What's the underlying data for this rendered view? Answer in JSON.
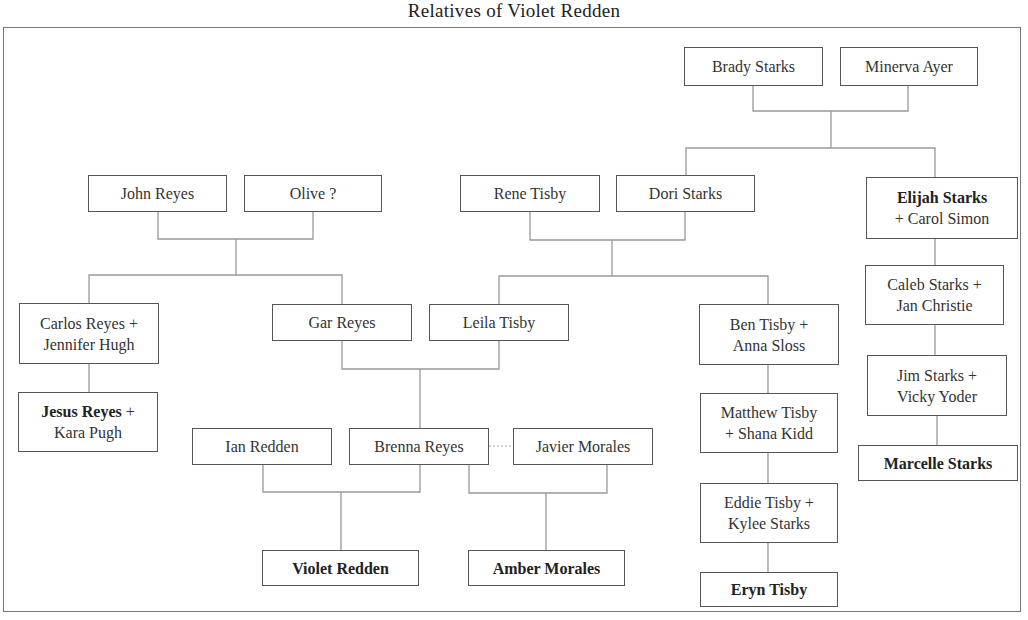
{
  "title": "Relatives of Violet Redden",
  "colors": {
    "box_border": "#555555",
    "line": "#999999",
    "frame": "#777777",
    "text": "#333333"
  },
  "nodes": {
    "brady_starks": {
      "lines": [
        {
          "text": "Brady Starks",
          "bold": false
        }
      ]
    },
    "minerva_ayer": {
      "lines": [
        {
          "text": "Minerva Ayer",
          "bold": false
        }
      ]
    },
    "john_reyes": {
      "lines": [
        {
          "text": "John Reyes",
          "bold": false
        }
      ]
    },
    "olive": {
      "lines": [
        {
          "text": "Olive ?",
          "bold": false
        }
      ]
    },
    "rene_tisby": {
      "lines": [
        {
          "text": "Rene Tisby",
          "bold": false
        }
      ]
    },
    "dori_starks": {
      "lines": [
        {
          "text": "Dori Starks",
          "bold": false
        }
      ]
    },
    "elijah_starks": {
      "lines": [
        {
          "text": "Elijah Starks",
          "bold": true
        },
        {
          "text": "+ Carol Simon",
          "bold": false
        }
      ]
    },
    "carlos_reyes": {
      "lines": [
        {
          "text": "Carlos Reyes +",
          "bold": false
        },
        {
          "text": "Jennifer Hugh",
          "bold": false
        }
      ]
    },
    "gar_reyes": {
      "lines": [
        {
          "text": "Gar Reyes",
          "bold": false
        }
      ]
    },
    "leila_tisby": {
      "lines": [
        {
          "text": "Leila Tisby",
          "bold": false
        }
      ]
    },
    "ben_tisby": {
      "lines": [
        {
          "text": "Ben Tisby +",
          "bold": false
        },
        {
          "text": "Anna Sloss",
          "bold": false
        }
      ]
    },
    "caleb_starks": {
      "lines": [
        {
          "text": "Caleb Starks +",
          "bold": false
        },
        {
          "text": "Jan Christie",
          "bold": false
        }
      ]
    },
    "jesus_reyes": {
      "lines": [
        {
          "text": "Jesus Reyes",
          "bold": true,
          "suffix": " +"
        },
        {
          "text": "Kara Pugh",
          "bold": false
        }
      ]
    },
    "ian_redden": {
      "lines": [
        {
          "text": "Ian Redden",
          "bold": false
        }
      ]
    },
    "brenna_reyes": {
      "lines": [
        {
          "text": "Brenna Reyes",
          "bold": false
        }
      ]
    },
    "javier_morales": {
      "lines": [
        {
          "text": "Javier Morales",
          "bold": false
        }
      ]
    },
    "matthew_tisby": {
      "lines": [
        {
          "text": "Matthew Tisby",
          "bold": false
        },
        {
          "text": "+ Shana Kidd",
          "bold": false
        }
      ]
    },
    "jim_starks": {
      "lines": [
        {
          "text": "Jim Starks +",
          "bold": false
        },
        {
          "text": "Vicky Yoder",
          "bold": false
        }
      ]
    },
    "marcelle_starks": {
      "lines": [
        {
          "text": "Marcelle Starks",
          "bold": true
        }
      ]
    },
    "eddie_tisby": {
      "lines": [
        {
          "text": "Eddie Tisby +",
          "bold": false
        },
        {
          "text": "Kylee Starks",
          "bold": false
        }
      ]
    },
    "violet_redden": {
      "lines": [
        {
          "text": "Violet Redden",
          "bold": true
        }
      ]
    },
    "amber_morales": {
      "lines": [
        {
          "text": "Amber Morales",
          "bold": true
        }
      ]
    },
    "eryn_tisby": {
      "lines": [
        {
          "text": "Eryn Tisby",
          "bold": true
        }
      ]
    }
  }
}
